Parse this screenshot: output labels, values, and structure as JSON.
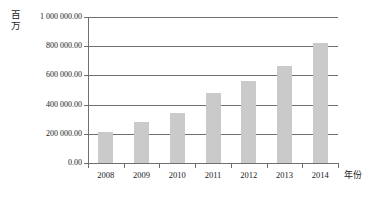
{
  "chart_data": {
    "type": "bar",
    "title": "",
    "xlabel": "年份",
    "ylabel": "百万",
    "categories": [
      "2008",
      "2009",
      "2010",
      "2011",
      "2012",
      "2013",
      "2014"
    ],
    "values": [
      210000,
      282000,
      342000,
      480000,
      562000,
      665000,
      825000
    ],
    "series": [
      {
        "name": "",
        "values": [
          210000,
          282000,
          342000,
          480000,
          562000,
          665000,
          825000
        ]
      }
    ],
    "ylim": [
      0,
      1000000
    ],
    "ytick_values": [
      0,
      200000,
      400000,
      600000,
      800000,
      1000000
    ],
    "ytick_labels": [
      "0.00",
      "200 000.00",
      "400 000.00",
      "600 000.00",
      "800 000.00",
      "1 000 000.00"
    ],
    "grid": "horizontal",
    "legend": "none",
    "bar_color": "#cacaca",
    "axis_color": "#6f6f6f"
  },
  "axes": {
    "y_unit_chars": [
      "百",
      "万"
    ],
    "x_unit": "年份"
  }
}
